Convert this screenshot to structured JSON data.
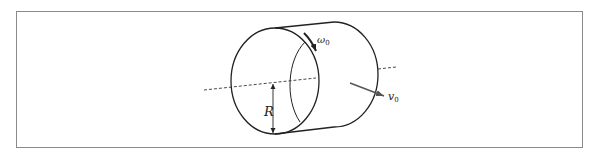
{
  "figure": {
    "type": "physics-diagram",
    "labels": {
      "radius": "R",
      "angular_velocity": "ω",
      "angular_velocity_sub": "0",
      "velocity": "v",
      "velocity_sub": "0"
    },
    "elements": [
      {
        "name": "cylinder",
        "description": "horizontal cylinder drawn in oblique perspective"
      },
      {
        "name": "axis",
        "style": "dashed",
        "description": "central axis through the cylinder"
      },
      {
        "name": "radius-marker",
        "label": "R",
        "description": "double-headed arrow from axis to bottom rim"
      },
      {
        "name": "rotation-arrow",
        "label": "ω0",
        "description": "curved arrow along the front rim"
      },
      {
        "name": "velocity-arrow",
        "label": "v0",
        "description": "straight arrow showing translational velocity"
      }
    ],
    "colors": {
      "stroke": "#222222",
      "frame": "#8a8a8a",
      "arrow_v": "#555555"
    }
  }
}
